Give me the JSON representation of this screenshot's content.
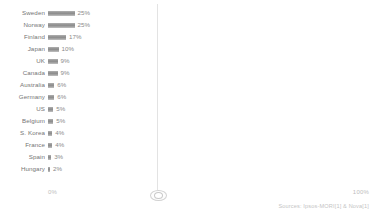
{
  "chart_data": {
    "type": "bar",
    "orientation": "horizontal",
    "title": "",
    "xlabel": "",
    "ylabel": "",
    "xlim": [
      0,
      100
    ],
    "grid": false,
    "legend": null,
    "axis_ticks": {
      "min_label": "0%",
      "max_label": "100%"
    },
    "categories": [
      "Sweden",
      "Norway",
      "Finland",
      "Japan",
      "UK",
      "Canada",
      "Australia",
      "Germany",
      "US",
      "Belgium",
      "S. Korea",
      "France",
      "Spain",
      "Hungary"
    ],
    "values": [
      25,
      25,
      17,
      10,
      9,
      9,
      6,
      6,
      5,
      5,
      4,
      4,
      3,
      2
    ],
    "value_labels": [
      "25%",
      "25%",
      "17%",
      "10%",
      "9%",
      "9%",
      "6%",
      "6%",
      "5%",
      "5%",
      "4%",
      "4%",
      "3%",
      "2%"
    ],
    "bar_color": "#9a9a9a",
    "label_color": "#757575"
  },
  "footer": {
    "source_text": "Sources: Ipsos-MORI[1] & Nova[1]"
  },
  "divider": {
    "grip_name": "panel-resize-grip"
  }
}
